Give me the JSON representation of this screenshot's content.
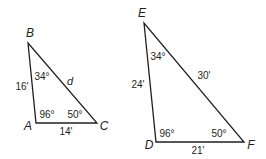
{
  "colors": {
    "stroke": "#231f20",
    "background": "#ffffff"
  },
  "triangle_abc": {
    "vertices": {
      "A": {
        "label": "A",
        "x": 36,
        "y": 123
      },
      "B": {
        "label": "B",
        "x": 28,
        "y": 43
      },
      "C": {
        "label": "C",
        "x": 97,
        "y": 123
      }
    },
    "sides": {
      "AB": "16'",
      "AC": "14'",
      "BC": "d"
    },
    "angles": {
      "A": "96°",
      "B": "34°",
      "C": "50°"
    }
  },
  "triangle_def": {
    "vertices": {
      "D": {
        "label": "D",
        "x": 156,
        "y": 142
      },
      "E": {
        "label": "E",
        "x": 144,
        "y": 23
      },
      "F": {
        "label": "F",
        "x": 244,
        "y": 142
      }
    },
    "sides": {
      "DE": "24'",
      "DF": "21'",
      "EF": "30'"
    },
    "angles": {
      "D": "96°",
      "E": "34°",
      "F": "50°"
    }
  }
}
